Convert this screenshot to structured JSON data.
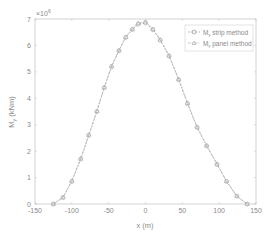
{
  "chart_data": {
    "type": "line",
    "title": "",
    "xlabel": "x (m)",
    "ylabel": "M_y (kNm)",
    "y_multiplier": "×10^6",
    "xlim": [
      -150,
      150
    ],
    "ylim": [
      0,
      7
    ],
    "x_ticks": [
      -150,
      -100,
      -50,
      0,
      50,
      100,
      150
    ],
    "y_ticks": [
      0,
      1,
      2,
      3,
      4,
      5,
      6,
      7
    ],
    "grid": false,
    "legend_position": "upper right",
    "series": [
      {
        "name": "M_y strip method",
        "marker": "circle",
        "line": "dashed",
        "color": "#9a9a9a",
        "x": [
          -125,
          -112,
          -100,
          -88,
          -77,
          -66,
          -56,
          -46,
          -36,
          -27,
          -18,
          -10,
          0,
          10,
          20,
          32,
          45,
          57,
          70,
          83,
          97,
          110,
          124,
          138
        ],
        "y": [
          0.0,
          0.25,
          0.85,
          1.7,
          2.6,
          3.5,
          4.4,
          5.2,
          5.8,
          6.3,
          6.6,
          6.8,
          6.85,
          6.6,
          6.2,
          5.6,
          4.7,
          3.8,
          2.9,
          2.2,
          1.5,
          0.85,
          0.3,
          0.0
        ]
      },
      {
        "name": "M_y panel method",
        "marker": "triangle",
        "line": "dashdot",
        "color": "#b0b0b0",
        "x": [
          -125,
          -112,
          -100,
          -88,
          -77,
          -66,
          -56,
          -46,
          -36,
          -27,
          -18,
          -10,
          0,
          10,
          20,
          32,
          45,
          57,
          70,
          83,
          97,
          110,
          124,
          138
        ],
        "y": [
          0.0,
          0.25,
          0.88,
          1.72,
          2.62,
          3.52,
          4.42,
          5.22,
          5.82,
          6.32,
          6.62,
          6.85,
          6.9,
          6.62,
          6.22,
          5.62,
          4.72,
          3.82,
          2.92,
          2.22,
          1.52,
          0.87,
          0.3,
          0.0
        ]
      }
    ]
  },
  "legend": {
    "items": [
      {
        "label": "M_y strip method"
      },
      {
        "label": "M_y panel method"
      }
    ]
  },
  "axes": {
    "x_label": "x (m)",
    "y_label": "M",
    "y_label_sub": "y",
    "y_label_unit": "(kNm)",
    "multiplier_base": "×10",
    "multiplier_exp": "6"
  }
}
